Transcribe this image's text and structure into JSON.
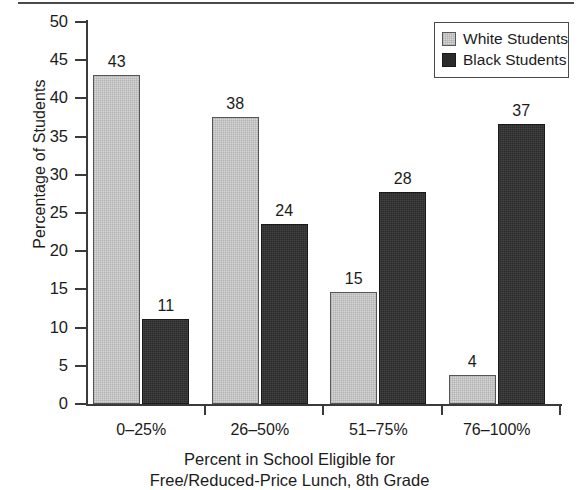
{
  "chart_data": {
    "type": "bar",
    "title": "",
    "subtitle": "",
    "xlabel": "Percent in School Eligible for Free/Reduced-Price Lunch, 8th Grade",
    "xlabel_lines": [
      "Percent in School Eligible for",
      "Free/Reduced-Price Lunch, 8th Grade"
    ],
    "ylabel": "Percentage of Students",
    "categories": [
      "0–25%",
      "26–50%",
      "51–75%",
      "76–100%"
    ],
    "series": [
      {
        "name": "White Students",
        "values": [
          43,
          38,
          15,
          4
        ],
        "plotted_values": [
          43.0,
          37.6,
          14.7,
          3.8
        ],
        "color": "#d6d6d6"
      },
      {
        "name": "Black Students",
        "values": [
          11,
          24,
          28,
          37
        ],
        "plotted_values": [
          11.1,
          23.6,
          27.8,
          36.7
        ],
        "color": "#2b2b2b"
      }
    ],
    "ylim": [
      0,
      50
    ],
    "yticks": [
      0,
      5,
      10,
      15,
      20,
      25,
      30,
      35,
      40,
      45,
      50
    ],
    "ytick_labels": [
      "0",
      "5",
      "10",
      "15",
      "20",
      "25",
      "30",
      "35",
      "40",
      "45",
      "50"
    ],
    "grid": false,
    "legend_position": "top-right",
    "legend_entries": [
      "White Students",
      "Black Students"
    ],
    "data_labels": [
      "43",
      "11",
      "38",
      "24",
      "15",
      "28",
      "4",
      "37"
    ]
  },
  "legend": {
    "items": [
      {
        "label": "White Students",
        "swatch": "white"
      },
      {
        "label": "Black Students",
        "swatch": "black"
      }
    ]
  },
  "colors": {
    "white_students": "#d6d6d6",
    "black_students": "#2b2b2b",
    "axis": "#3a3a3a",
    "text": "#1b1b1b",
    "background": "#ffffff"
  }
}
